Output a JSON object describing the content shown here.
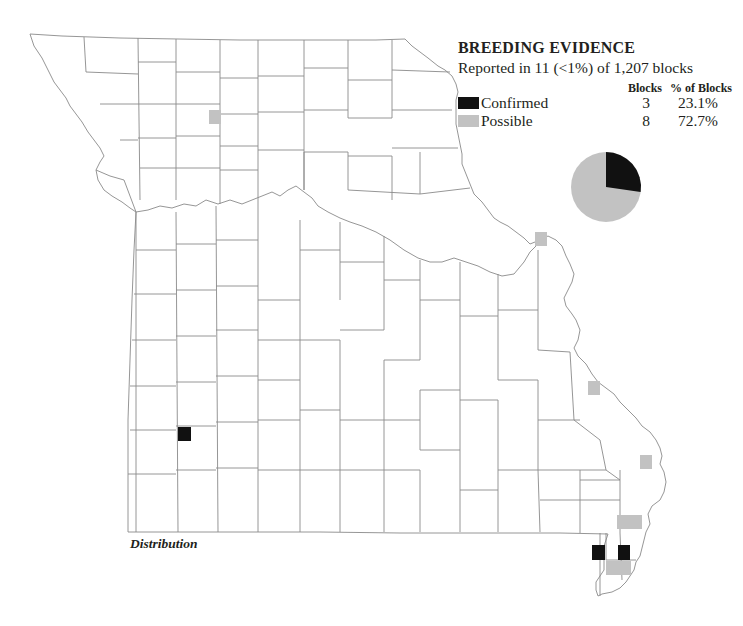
{
  "legend": {
    "title": "BREEDING EVIDENCE",
    "subtitle": "Reported in 11 (<1%) of 1,207 blocks",
    "columns": {
      "blocks": "Blocks",
      "percent": "% of Blocks"
    },
    "rows": [
      {
        "label": "Confirmed",
        "blocks": "3",
        "percent": "23.1%",
        "color": "#111111"
      },
      {
        "label": "Possible",
        "blocks": "8",
        "percent": "72.7%",
        "color": "#c2c2c2"
      }
    ]
  },
  "caption": "Distribution",
  "colors": {
    "confirmed": "#111111",
    "possible": "#c2c2c2",
    "county_line": "#8a8a8a",
    "background": "#ffffff"
  },
  "chart_data": {
    "type": "pie",
    "title": "BREEDING EVIDENCE",
    "categories": [
      "Confirmed",
      "Possible"
    ],
    "values": [
      3,
      8
    ],
    "percent_labels": [
      "23.1%",
      "72.7%"
    ],
    "colors": [
      "#111111",
      "#c2c2c2"
    ],
    "total_blocks_reported": 11,
    "total_blocks": 1207
  },
  "blocks": [
    {
      "status": "possible",
      "x": 209,
      "y": 110,
      "w": 12,
      "h": 14
    },
    {
      "status": "possible",
      "x": 535,
      "y": 232,
      "w": 12,
      "h": 14
    },
    {
      "status": "possible",
      "x": 588,
      "y": 381,
      "w": 12,
      "h": 14
    },
    {
      "status": "possible",
      "x": 640,
      "y": 455,
      "w": 12,
      "h": 14
    },
    {
      "status": "possible",
      "x": 617,
      "y": 515,
      "w": 25,
      "h": 14
    },
    {
      "status": "possible",
      "x": 606,
      "y": 561,
      "w": 25,
      "h": 14
    },
    {
      "status": "confirmed",
      "x": 178,
      "y": 427,
      "w": 13,
      "h": 14
    },
    {
      "status": "confirmed",
      "x": 592,
      "y": 545,
      "w": 13,
      "h": 15
    },
    {
      "status": "confirmed",
      "x": 618,
      "y": 545,
      "w": 12,
      "h": 15
    }
  ]
}
